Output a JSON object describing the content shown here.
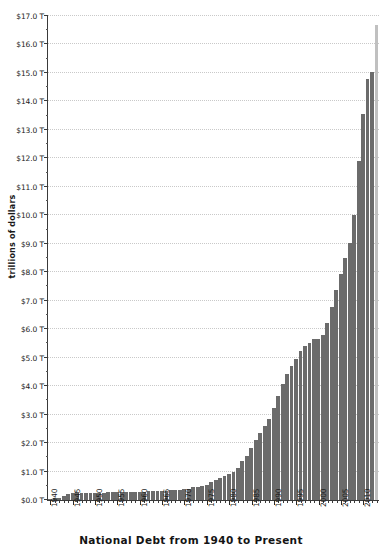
{
  "chart_data": {
    "type": "bar",
    "title": "National Debt from 1940 to Present",
    "xlabel": "",
    "ylabel": "trillions of dollars",
    "ylim": [
      0,
      17
    ],
    "ytick_step": 1,
    "grid": true,
    "legend": "none",
    "y_tick_labels": [
      "$0.0 T",
      "$1.0 T",
      "$2.0 T",
      "$3.0 T",
      "$4.0 T",
      "$5.0 T",
      "$6.0 T",
      "$7.0 T",
      "$8.0 T",
      "$9.0 T",
      "$10.0 T",
      "$11.0 T",
      "$12.0 T",
      "$13.0 T",
      "$14.0 T",
      "$15.0 T",
      "$16.0 T",
      "$17.0 T"
    ],
    "x_tick_labels": [
      "1940",
      "1945",
      "1950",
      "1955",
      "1960",
      "1965",
      "1970",
      "1975",
      "1980",
      "1985",
      "1990",
      "1995",
      "2000",
      "2005",
      "2010"
    ],
    "x_label_years": [
      1940,
      1945,
      1950,
      1955,
      1960,
      1965,
      1970,
      1975,
      1980,
      1985,
      1990,
      1995,
      2000,
      2005,
      2010
    ],
    "bar_color": "#6b6b6b",
    "highlight_color": "#c0c0c0",
    "axis_color": "#3a3a3a",
    "grid_color": "#c9c9c9",
    "categories": [
      1940,
      1941,
      1942,
      1943,
      1944,
      1945,
      1946,
      1947,
      1948,
      1949,
      1950,
      1951,
      1952,
      1953,
      1954,
      1955,
      1956,
      1957,
      1958,
      1959,
      1960,
      1961,
      1962,
      1963,
      1964,
      1965,
      1966,
      1967,
      1968,
      1969,
      1970,
      1971,
      1972,
      1973,
      1974,
      1975,
      1976,
      1977,
      1978,
      1979,
      1980,
      1981,
      1982,
      1983,
      1984,
      1985,
      1986,
      1987,
      1988,
      1989,
      1990,
      1991,
      1992,
      1993,
      1994,
      1995,
      1996,
      1997,
      1998,
      1999,
      2000,
      2001,
      2002,
      2003,
      2004,
      2005,
      2006,
      2007,
      2008,
      2009,
      2010,
      2011,
      2012,
      2013
    ],
    "values": [
      0.05,
      0.06,
      0.08,
      0.14,
      0.2,
      0.26,
      0.27,
      0.26,
      0.25,
      0.25,
      0.26,
      0.26,
      0.26,
      0.27,
      0.27,
      0.27,
      0.27,
      0.27,
      0.28,
      0.29,
      0.29,
      0.29,
      0.3,
      0.31,
      0.32,
      0.32,
      0.33,
      0.34,
      0.35,
      0.35,
      0.37,
      0.4,
      0.44,
      0.46,
      0.48,
      0.54,
      0.63,
      0.71,
      0.78,
      0.83,
      0.91,
      1.0,
      1.14,
      1.37,
      1.56,
      1.82,
      2.12,
      2.35,
      2.6,
      2.86,
      3.23,
      3.67,
      4.06,
      4.41,
      4.69,
      4.97,
      5.22,
      5.41,
      5.53,
      5.66,
      5.67,
      5.81,
      6.23,
      6.78,
      7.38,
      7.93,
      8.51,
      9.01,
      10.02,
      11.91,
      13.56,
      14.79,
      15.05,
      16.7
    ],
    "highlight_index": 73
  }
}
